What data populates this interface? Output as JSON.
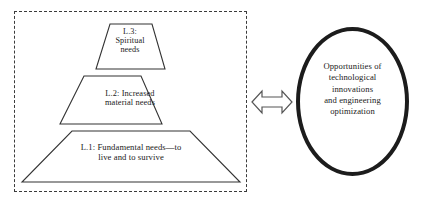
{
  "diagram": {
    "colors": {
      "dashed_border": "#3b3b3b",
      "trapezoid_outline": "#333333",
      "ellipse_border": "#1c1c1c",
      "arrow_outline": "#555555",
      "text": "#1a1a1a",
      "background": "#ffffff"
    },
    "pyramid": {
      "name": "needs-pyramid",
      "levels": [
        {
          "id": "L3",
          "order": 3,
          "position": "top",
          "label": "L.3:\nSpiritual\nneeds",
          "lines": [
            "L.3:",
            "Spiritual",
            "needs"
          ]
        },
        {
          "id": "L2",
          "order": 2,
          "position": "middle",
          "label": "L.2: Increased\nmaterial needs",
          "lines": [
            "L.2: Increased",
            "material needs"
          ]
        },
        {
          "id": "L1",
          "order": 1,
          "position": "bottom",
          "label": "L.1: Fundamental needs—to\nlive and to survive",
          "lines": [
            "L.1: Fundamental needs—to",
            "live and to survive"
          ]
        }
      ]
    },
    "connector": {
      "name": "bidirectional-arrow",
      "type": "double-headed-arrow",
      "direction": "both"
    },
    "ellipse": {
      "name": "opportunities-ellipse",
      "label": "Opportunities of\ntechnological\ninnovations\nand engineering\noptimization",
      "lines": [
        "Opportunities of",
        "technological",
        "innovations",
        "and engineering",
        "optimization"
      ]
    }
  }
}
